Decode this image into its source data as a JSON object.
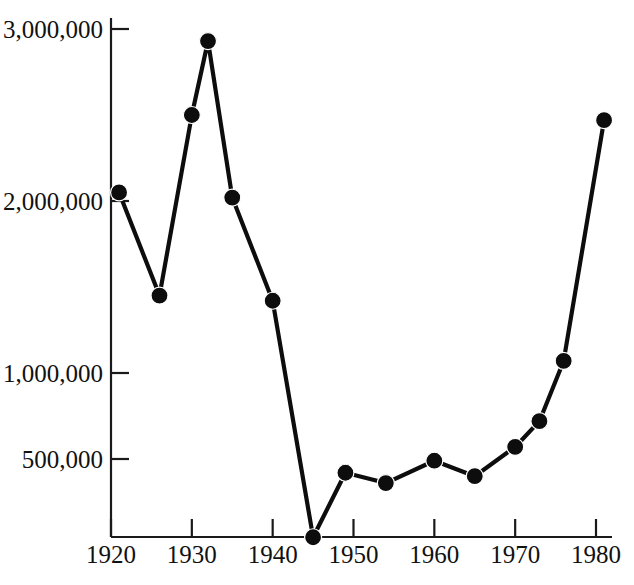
{
  "chart_data": {
    "type": "line",
    "title": "",
    "subtitle": "",
    "xlabel": "",
    "ylabel": "",
    "xlim": [
      1920,
      1982.5
    ],
    "ylim": [
      0,
      3100000
    ],
    "grid": false,
    "legend": null,
    "markers": "filled-circle",
    "x_tick_labels": [
      "1920",
      "1930",
      "1940",
      "1950",
      "1960",
      "1970",
      "1980"
    ],
    "x_ticks": [
      1920,
      1930,
      1940,
      1950,
      1960,
      1970,
      1980
    ],
    "y_tick_labels": [
      "500,000",
      "1,000,000",
      "2,000,000",
      "3,000,000"
    ],
    "y_ticks": [
      500000,
      1000000,
      2000000,
      3000000
    ],
    "x": [
      1921,
      1926,
      1930,
      1932,
      1935,
      1940,
      1945,
      1949,
      1954,
      1960,
      1965,
      1970,
      1973,
      1976,
      1981
    ],
    "values": [
      2050000,
      1450000,
      2500000,
      2930000,
      2020000,
      1420000,
      45000,
      420000,
      360000,
      490000,
      400000,
      570000,
      720000,
      1070000,
      2470000
    ],
    "points": [
      {
        "x": 1921,
        "y": 2050000
      },
      {
        "x": 1926,
        "y": 1450000
      },
      {
        "x": 1930,
        "y": 2500000
      },
      {
        "x": 1932,
        "y": 2930000
      },
      {
        "x": 1935,
        "y": 2020000
      },
      {
        "x": 1940,
        "y": 1420000
      },
      {
        "x": 1945,
        "y": 45000
      },
      {
        "x": 1949,
        "y": 420000
      },
      {
        "x": 1954,
        "y": 360000
      },
      {
        "x": 1960,
        "y": 490000
      },
      {
        "x": 1965,
        "y": 400000
      },
      {
        "x": 1970,
        "y": 570000
      },
      {
        "x": 1973,
        "y": 720000
      },
      {
        "x": 1976,
        "y": 1070000
      },
      {
        "x": 1981,
        "y": 2470000
      }
    ],
    "colors": {
      "line": "#0d0d0d",
      "marker": "#0d0d0d",
      "axis": "#1a1a1a",
      "text": "#111111",
      "background": "#ffffff"
    }
  }
}
